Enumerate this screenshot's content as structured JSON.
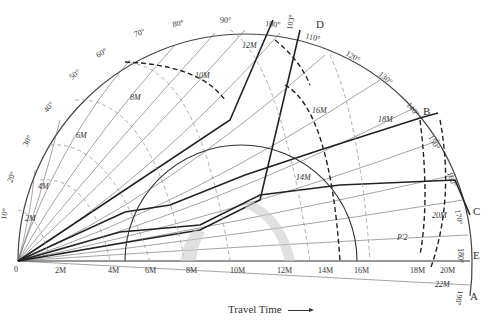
{
  "figure": {
    "caption": "Travel Time",
    "origin_label": "0",
    "angle_labels": [
      "10°",
      "20°",
      "30°",
      "40°",
      "50°",
      "60°",
      "70°",
      "80°",
      "90°",
      "100°",
      "103°",
      "110°",
      "120°",
      "130°",
      "140°",
      "150°",
      "160°",
      "170°",
      "180°",
      "190°"
    ],
    "axis_time_labels": [
      "2M",
      "4M",
      "6M",
      "8M",
      "10M",
      "12M",
      "14M",
      "16M",
      "18M",
      "20M"
    ],
    "curve_labels": [
      "2M",
      "4M",
      "6M",
      "8M",
      "10M",
      "12M",
      "14M",
      "16M",
      "18M",
      "20M",
      "22M"
    ],
    "ray_letters": [
      "A",
      "B",
      "C",
      "D",
      "E"
    ],
    "annotation": "P'2"
  }
}
